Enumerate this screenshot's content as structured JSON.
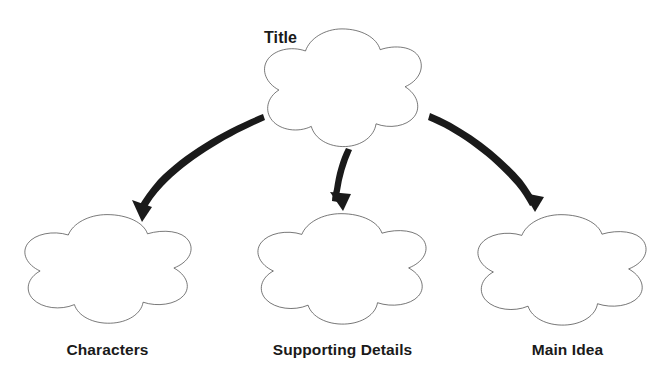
{
  "diagram": {
    "type": "graphic-organizer",
    "background_color": "#ffffff",
    "shape_outline_color": "#4a4a4a",
    "arrow_color": "#1a1a1a",
    "label_color": "#1a1a1a",
    "nodes": [
      {
        "id": "title",
        "label": "Title",
        "shape": "flower",
        "level": "parent",
        "center_x": 342,
        "center_y": 90,
        "radius_x": 83,
        "radius_y": 65,
        "label_position": "left-of-shape"
      },
      {
        "id": "characters",
        "label": "Characters",
        "shape": "flower",
        "level": "child",
        "center_x": 107,
        "center_y": 271,
        "radius_x": 88,
        "radius_y": 60,
        "label_position": "below-shape"
      },
      {
        "id": "supporting-details",
        "label": "Supporting Details",
        "shape": "flower",
        "level": "child",
        "center_x": 341,
        "center_y": 271,
        "radius_x": 89,
        "radius_y": 61,
        "label_position": "below-shape"
      },
      {
        "id": "main-idea",
        "label": "Main Idea",
        "shape": "flower",
        "level": "child",
        "center_x": 561,
        "center_y": 272,
        "radius_x": 89,
        "radius_y": 61,
        "label_position": "below-shape"
      }
    ],
    "arrows": [
      {
        "id": "arrow-to-characters",
        "from": "title",
        "to": "characters",
        "direction": "down-left",
        "style": "curved",
        "start_x": 264,
        "start_y": 121,
        "end_x": 142,
        "end_y": 217
      },
      {
        "id": "arrow-to-supporting-details",
        "from": "title",
        "to": "supporting-details",
        "direction": "down",
        "style": "curved",
        "start_x": 352,
        "start_y": 151,
        "end_x": 343,
        "end_y": 207
      },
      {
        "id": "arrow-to-main-idea",
        "from": "title",
        "to": "main-idea",
        "direction": "down-right",
        "style": "curved",
        "start_x": 430,
        "start_y": 114,
        "end_x": 534,
        "end_y": 207
      }
    ]
  }
}
